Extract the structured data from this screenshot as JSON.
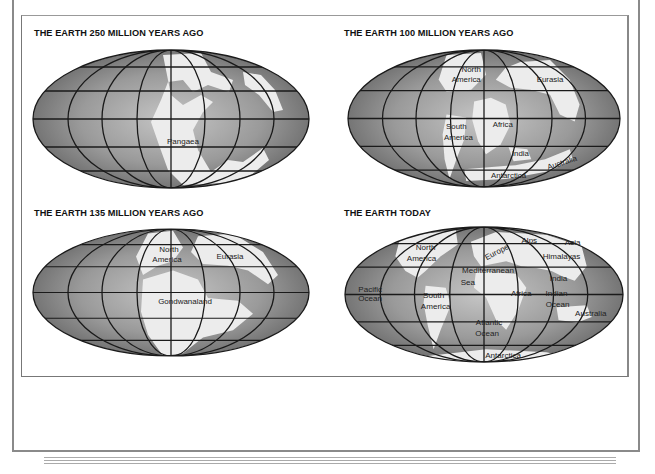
{
  "figure": {
    "panels": [
      {
        "title": "THE EARTH 250 MILLION YEARS AGO",
        "labels": [
          "Pangaea"
        ]
      },
      {
        "title": "THE EARTH 100 MILLION YEARS AGO",
        "labels": [
          "North",
          "America",
          "Eurasia",
          "South",
          "America",
          "Africa",
          "India",
          "Australia",
          "Antarctica"
        ]
      },
      {
        "title": "THE EARTH 135 MILLION YEARS AGO",
        "labels": [
          "North",
          "America",
          "Eurasia",
          "Gondwanaland"
        ]
      },
      {
        "title": "THE EARTH TODAY",
        "labels": [
          "North",
          "America",
          "Europe",
          "Alps",
          "Asia",
          "Himalayas",
          "Mediterranean",
          "Sea",
          "India",
          "Pacific",
          "Ocean",
          "South",
          "America",
          "Africa",
          "Indian",
          "Ocean",
          "Atlantic",
          "Ocean",
          "Australia",
          "Antarctica"
        ]
      }
    ]
  },
  "colors": {
    "ocean_dark": "#6e6e6e",
    "ocean_light": "#b4b4b4",
    "land": "#ececec",
    "grid": "#1a1a1a",
    "frame": "#8a8a8a"
  }
}
